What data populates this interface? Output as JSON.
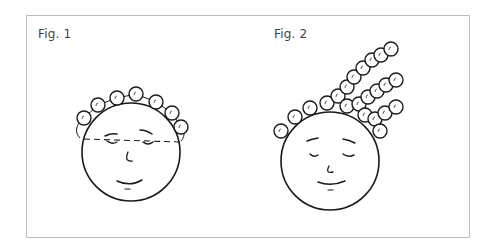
{
  "figures": [
    {
      "label": "Fig. 1",
      "label_pos": [
        38,
        27
      ],
      "head": {
        "cx": 131,
        "cy": 152,
        "r": 49
      },
      "curlers": [
        [
          84,
          118
        ],
        [
          98,
          105
        ],
        [
          117,
          98
        ],
        [
          136,
          94
        ],
        [
          156,
          102
        ],
        [
          172,
          113
        ],
        [
          181,
          127
        ]
      ],
      "curler_r": 7,
      "dashed_line": {
        "x1": 84,
        "y1": 139,
        "x2": 180,
        "y2": 142
      },
      "face": {
        "brows": [
          [
            105,
            136,
            111,
            133,
            117,
            134
          ],
          [
            140,
            130,
            146,
            130,
            152,
            134
          ]
        ],
        "eyes": [
          [
            107,
            141,
            112,
            145,
            117,
            142
          ],
          [
            143,
            142,
            148,
            146,
            153,
            142
          ]
        ],
        "nose": [
          128,
          152,
          124,
          162,
          132,
          161
        ],
        "mouth": [
          117,
          181,
          130,
          187,
          142,
          180
        ],
        "chin": [
          125,
          189,
          130,
          189
        ]
      }
    },
    {
      "label": "Fig. 2",
      "label_pos": [
        274,
        27
      ],
      "head": {
        "cx": 330,
        "cy": 161,
        "r": 49
      },
      "curlers": [
        [
          281,
          131
        ],
        [
          295,
          117
        ],
        [
          310,
          108
        ],
        [
          327,
          103
        ],
        [
          338,
          96
        ],
        [
          347,
          87
        ],
        [
          354,
          77
        ],
        [
          363,
          68
        ],
        [
          372,
          60
        ],
        [
          381,
          55
        ],
        [
          391,
          49
        ],
        [
          347,
          106
        ],
        [
          359,
          104
        ],
        [
          368,
          97
        ],
        [
          377,
          91
        ],
        [
          386,
          85
        ],
        [
          396,
          80
        ],
        [
          365,
          115
        ],
        [
          375,
          119
        ],
        [
          385,
          113
        ],
        [
          396,
          107
        ],
        [
          380,
          131
        ]
      ],
      "curler_r": 7,
      "face": {
        "brows": [
          [
            307,
            141,
            312,
            139,
            318,
            138
          ],
          [
            343,
            139,
            349,
            140,
            355,
            143
          ]
        ],
        "eyes": [
          [
            310,
            154,
            314,
            158,
            318,
            155
          ],
          [
            343,
            154,
            348,
            158,
            354,
            155
          ]
        ],
        "nose": [
          329,
          166,
          325,
          174,
          333,
          172
        ],
        "mouth": [
          318,
          182,
          331,
          187,
          345,
          181
        ],
        "chin": [
          328,
          190,
          333,
          190
        ]
      }
    }
  ],
  "colors": {
    "line": "#1a1a1a",
    "frame": "#bdbdbd",
    "label": "#444444"
  }
}
